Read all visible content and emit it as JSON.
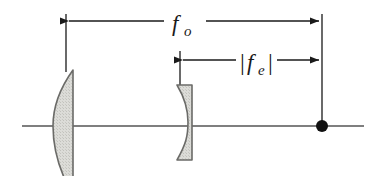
{
  "figure": {
    "kind": "optical-ray-diagram",
    "background_color": "#ffffff",
    "line_color": "#1a1a1a",
    "axis_color": "#555555",
    "glass_fill_color": "#d8d8d4",
    "glass_edge_color": "#6b6b68"
  },
  "dimensions": {
    "objective_focal_length": {
      "label_main": "f",
      "label_sub": "o",
      "full_label": "f_o",
      "name": "objective focal length",
      "arrow_y": 21,
      "arrow_x_start": 66,
      "arrow_x_end": 322,
      "both_ends_arrow": true
    },
    "eyepiece_focal_length": {
      "label_open_bar": "|",
      "label_main": "f",
      "label_sub": "e",
      "label_close_bar": "|",
      "full_label": "|f_e|",
      "name": "eyepiece focal length magnitude",
      "arrow_y": 60,
      "arrow_x_start": 180,
      "arrow_x_end": 322,
      "both_ends_arrow": true
    }
  },
  "optical_axis": {
    "name": "optical-axis",
    "y": 126,
    "x_start": 22,
    "x_end": 364
  },
  "elements": {
    "objective_lens": {
      "name": "objective-lens",
      "type": "plano-convex converging lens",
      "flat_side": "right",
      "curved_side": "left",
      "x_flat": 73,
      "x_apex": 53,
      "y_top": 70,
      "y_bottom": 182
    },
    "eyepiece_lens": {
      "name": "eyepiece-lens",
      "type": "negative meniscus diverging lens",
      "x_left": 177,
      "x_right": 192,
      "y_top": 85,
      "y_bottom": 160
    },
    "focal_point": {
      "name": "common-focal-point",
      "x": 322,
      "y": 126,
      "radius": 6
    }
  },
  "extension_lines": [
    {
      "name": "objective-extension-line",
      "x": 66,
      "y_top": 14,
      "y_bottom": 72
    },
    {
      "name": "eyepiece-extension-line",
      "x": 180,
      "y_top": 51,
      "y_bottom": 86
    },
    {
      "name": "focal-point-extension-line",
      "x": 322,
      "y_top": 14,
      "y_bottom": 126
    }
  ]
}
